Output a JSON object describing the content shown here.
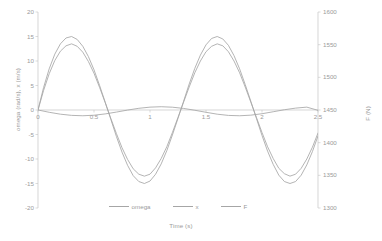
{
  "chart_data": {
    "type": "line",
    "title": "",
    "xlabel": "Time (s)",
    "ylabel": "omega (rad/s), x (m/s)",
    "ylabel_secondary": "F (N)",
    "xlim": [
      0,
      2.5
    ],
    "ylim": [
      -20,
      20
    ],
    "ylim_secondary": [
      1300,
      1600
    ],
    "xticks": [
      "0",
      "0.5",
      "1",
      "1.5",
      "2",
      "2.5"
    ],
    "xtick_values": [
      0,
      0.5,
      1,
      1.5,
      2,
      2.5
    ],
    "yticks": [
      "20",
      "15",
      "10",
      "5",
      "0",
      "-5",
      "-10",
      "-15",
      "-20"
    ],
    "ytick_values": [
      20,
      15,
      10,
      5,
      0,
      -5,
      -10,
      -15,
      -20
    ],
    "yticks_secondary": [
      "1600",
      "1550",
      "1500",
      "1450",
      "1400",
      "1350",
      "1300"
    ],
    "ytick_secondary_values": [
      1600,
      1550,
      1500,
      1450,
      1400,
      1350,
      1300
    ],
    "grid": false,
    "legend_position": "bottom",
    "line_color": "#a6a6a6",
    "text_color": "#9b9b9b",
    "series": [
      {
        "name": "omega",
        "axis": "left",
        "color": "#a6a6a6",
        "x": [
          0,
          0.05,
          0.1,
          0.15,
          0.2,
          0.25,
          0.3,
          0.35,
          0.4,
          0.45,
          0.5,
          0.55,
          0.6,
          0.65,
          0.7,
          0.75,
          0.8,
          0.85,
          0.9,
          0.95,
          1,
          1.05,
          1.1,
          1.15,
          1.2,
          1.25,
          1.3,
          1.35,
          1.4,
          1.45,
          1.5,
          1.55,
          1.6,
          1.65,
          1.7,
          1.75,
          1.8,
          1.85,
          1.9,
          1.95,
          2,
          2.05,
          2.1,
          2.15,
          2.2,
          2.25,
          2.3,
          2.35,
          2.4,
          2.45,
          2.5
        ],
        "values": [
          0,
          4.6,
          8.4,
          11.4,
          13.5,
          14.7,
          15,
          14.4,
          13,
          10.9,
          8.2,
          5,
          1.6,
          -1.9,
          -5.4,
          -8.6,
          -11.3,
          -13.4,
          -14.6,
          -15,
          -14.5,
          -13.1,
          -11,
          -8.3,
          -5.1,
          -1.7,
          1.8,
          5.3,
          8.5,
          11.2,
          13.3,
          14.6,
          15,
          14.5,
          13.2,
          11.1,
          8.4,
          5.2,
          1.8,
          -1.7,
          -5.2,
          -8.4,
          -11.1,
          -13.3,
          -14.6,
          -15,
          -14.6,
          -13.3,
          -11.2,
          -8.5,
          -5.3
        ]
      },
      {
        "name": "x",
        "axis": "left",
        "color": "#a6a6a6",
        "x": [
          0,
          0.05,
          0.1,
          0.15,
          0.2,
          0.25,
          0.3,
          0.35,
          0.4,
          0.45,
          0.5,
          0.55,
          0.6,
          0.65,
          0.7,
          0.75,
          0.8,
          0.85,
          0.9,
          0.95,
          1,
          1.05,
          1.1,
          1.15,
          1.2,
          1.25,
          1.3,
          1.35,
          1.4,
          1.45,
          1.5,
          1.55,
          1.6,
          1.65,
          1.7,
          1.75,
          1.8,
          1.85,
          1.9,
          1.95,
          2,
          2.05,
          2.1,
          2.15,
          2.2,
          2.25,
          2.3,
          2.35,
          2.4,
          2.45,
          2.5
        ],
        "values": [
          0,
          4.0,
          7.4,
          10.1,
          12.0,
          13.1,
          13.5,
          13.0,
          11.8,
          9.9,
          7.5,
          4.6,
          1.5,
          -1.7,
          -4.8,
          -7.7,
          -10.1,
          -12.0,
          -13.1,
          -13.5,
          -13.1,
          -11.8,
          -9.9,
          -7.5,
          -4.6,
          -1.5,
          1.6,
          4.7,
          7.6,
          10.0,
          11.9,
          13.0,
          13.5,
          13.1,
          11.9,
          10.0,
          7.6,
          4.7,
          1.6,
          -1.5,
          -4.6,
          -7.5,
          -9.9,
          -11.9,
          -13.0,
          -13.5,
          -13.1,
          -11.9,
          -10.0,
          -7.6,
          -4.7
        ]
      },
      {
        "name": "F",
        "axis": "right",
        "color": "#a6a6a6",
        "x": [
          0,
          0.1,
          0.2,
          0.3,
          0.4,
          0.5,
          0.6,
          0.7,
          0.8,
          0.9,
          1,
          1.1,
          1.2,
          1.3,
          1.4,
          1.5,
          1.6,
          1.7,
          1.8,
          1.9,
          2,
          2.1,
          2.2,
          2.3,
          2.4,
          2.5
        ],
        "values": [
          1450.0,
          1446.5,
          1443.6,
          1441.8,
          1441.2,
          1442.0,
          1444.0,
          1446.8,
          1449.9,
          1452.6,
          1454.4,
          1455.0,
          1454.3,
          1452.4,
          1449.6,
          1446.5,
          1443.6,
          1441.7,
          1441.2,
          1442.1,
          1444.3,
          1447.3,
          1450.4,
          1452.9,
          1454.4,
          1449.5
        ]
      }
    ]
  },
  "legend": {
    "items": [
      {
        "label": "omega"
      },
      {
        "label": "x"
      },
      {
        "label": "F"
      }
    ]
  }
}
